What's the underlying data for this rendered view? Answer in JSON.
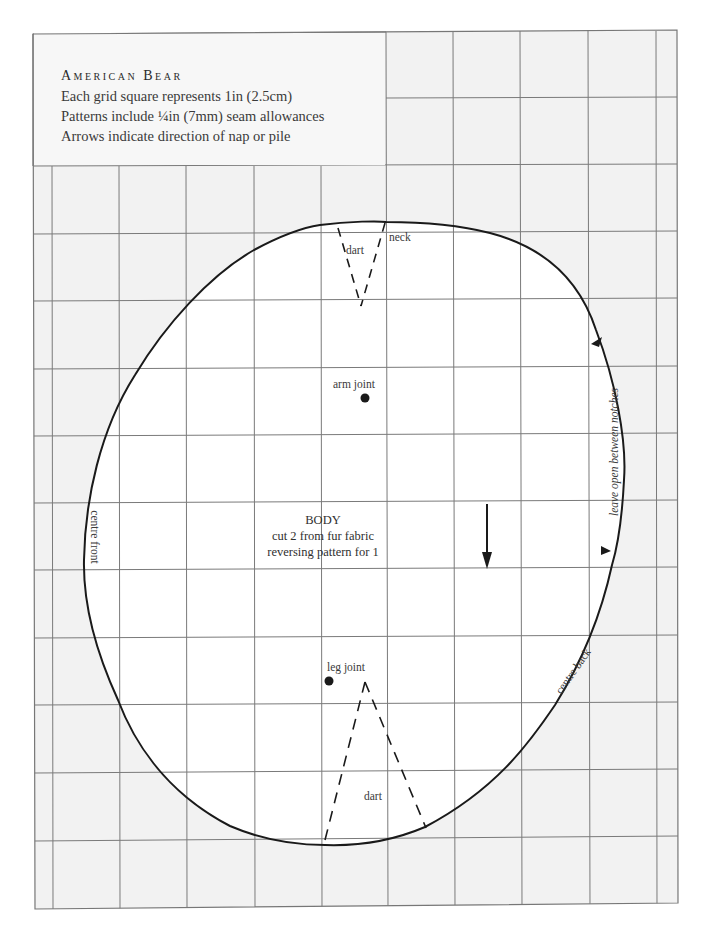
{
  "header": {
    "title": "American Bear",
    "lines": [
      "Each grid square represents 1in (2.5cm)",
      "Patterns include ¼in (7mm) seam allowances",
      "Arrows indicate direction of nap or pile"
    ]
  },
  "pattern_piece": {
    "name": "BODY",
    "instructions": [
      "cut 2 from fur fabric",
      "reversing pattern for 1"
    ],
    "labels": {
      "neck_dart": "dart",
      "neck": "neck",
      "arm_joint": "arm joint",
      "leg_joint": "leg joint",
      "leg_dart": "dart",
      "centre_front": "centre front",
      "centre_back": "centre back",
      "opening": "leave open between notches"
    },
    "nap_arrow": "down-arrow-icon"
  },
  "grid": {
    "square_size_px": 67,
    "unit": "1in (2.5cm)",
    "line_color": "#7a7a7a",
    "outside_fill": "#f2f2f2",
    "inside_fill": "#ffffff"
  },
  "colors": {
    "outline": "#1a1a1a",
    "text": "#3a3a3a"
  }
}
